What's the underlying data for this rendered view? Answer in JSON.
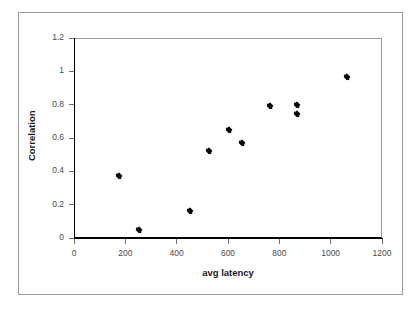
{
  "chart_data": {
    "type": "scatter",
    "title": "",
    "subtitle": "",
    "xlabel": "avg latency",
    "ylabel": "Correlation",
    "xlim": [
      0,
      1200
    ],
    "ylim": [
      0,
      1.2
    ],
    "xticks": [
      0,
      200,
      400,
      600,
      800,
      1000,
      1200
    ],
    "yticks": [
      0,
      0.2,
      0.4,
      0.6,
      0.8,
      1,
      1.2
    ],
    "xtick_labels": [
      "0",
      "200",
      "400",
      "600",
      "800",
      "1000",
      "1200"
    ],
    "ytick_labels": [
      "0",
      "0.2",
      "0.4",
      "0.6",
      "0.8",
      "1",
      "1.2"
    ],
    "grid": false,
    "legend": false,
    "legend_position": "none",
    "marker_style": "diamond",
    "marker_color": "#000000",
    "series": [
      {
        "name": "Correlation vs avg latency",
        "points": [
          {
            "x": 175,
            "y": 0.375
          },
          {
            "x": 255,
            "y": 0.05
          },
          {
            "x": 450,
            "y": 0.16
          },
          {
            "x": 525,
            "y": 0.52
          },
          {
            "x": 605,
            "y": 0.65
          },
          {
            "x": 655,
            "y": 0.57
          },
          {
            "x": 765,
            "y": 0.79
          },
          {
            "x": 870,
            "y": 0.8
          },
          {
            "x": 870,
            "y": 0.745
          },
          {
            "x": 1065,
            "y": 0.965
          }
        ]
      }
    ]
  },
  "colors": {
    "marker": "#000000",
    "axis": "#000000",
    "frame": "#9a9a9a",
    "tick_label": "#4a4a4a",
    "background": "#ffffff"
  }
}
